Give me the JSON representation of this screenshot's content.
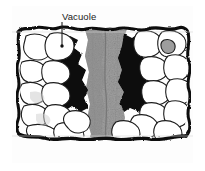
{
  "figure": {
    "kind": "micrograph-cross-section",
    "background_color": "#ffffff",
    "frame_color": "#b9b9b9",
    "plate_background": "#fdfdfd"
  },
  "annotations": [
    {
      "id": "vacuole",
      "label": "Vacuole",
      "text_color": "#1a1a1a",
      "leader_line": {
        "color": "#2b2b2b",
        "x1": 62,
        "y1": 22,
        "x2": 62,
        "y2": 46
      },
      "pointer_dot": {
        "x": 62,
        "y": 46,
        "r": 1.6,
        "color": "#1a1a1a"
      }
    }
  ],
  "specimen": {
    "outline_color": "#111111",
    "cell_fill": "#ffffff",
    "cell_outline": "#222222",
    "vacuole_fill": "#000000",
    "central_column_fill": "#9a9a9a",
    "central_column_texture": "#7d7d7d",
    "bounds": {
      "left": 18,
      "top": 28,
      "right": 186,
      "bottom": 140
    },
    "regions": [
      {
        "name": "upper-boundary",
        "type": "wavy-dark-edge"
      },
      {
        "name": "left-cell-file",
        "type": "white-cells"
      },
      {
        "name": "left-vacuole",
        "type": "dark-mass"
      },
      {
        "name": "central-column",
        "type": "mottled-gray"
      },
      {
        "name": "right-vacuole",
        "type": "dark-mass"
      },
      {
        "name": "right-cell-file",
        "type": "white-cells"
      },
      {
        "name": "lower-boundary",
        "type": "wavy-dark-edge"
      }
    ]
  }
}
